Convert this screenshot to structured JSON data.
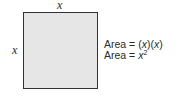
{
  "diagram": {
    "shape": "square",
    "fill_color": "#e6e6e6",
    "stroke_color": "#333333",
    "top_side_label": "x",
    "left_side_label": "x",
    "formulas": [
      {
        "prefix": "Area = ",
        "expression": "(x)(x)",
        "parts": [
          "(",
          "x",
          ")(",
          "x",
          ")"
        ]
      },
      {
        "prefix": "Area = ",
        "expression": "x²",
        "base": "x",
        "exponent": "2"
      }
    ]
  }
}
